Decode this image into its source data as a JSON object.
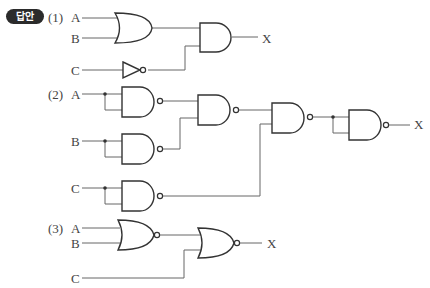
{
  "badge": {
    "label": "답안"
  },
  "circuits": [
    {
      "number": "(1)",
      "inputs": [
        "A",
        "B",
        "C"
      ],
      "output": "X",
      "gates": [
        "OR(A,B)",
        "NOT(C)",
        "AND(OR, NOT)"
      ]
    },
    {
      "number": "(2)",
      "inputs": [
        "A",
        "B",
        "C"
      ],
      "output": "X",
      "gates": [
        "NAND(A,A)",
        "NAND(B,B)",
        "NAND(C,C)",
        "NAND(g1,g2)",
        "NAND(g4,g3)",
        "NAND(g5,g5)"
      ]
    },
    {
      "number": "(3)",
      "inputs": [
        "A",
        "B",
        "C"
      ],
      "output": "X",
      "gates": [
        "NOR(A,B)",
        "NOR(g1,C)"
      ]
    }
  ]
}
